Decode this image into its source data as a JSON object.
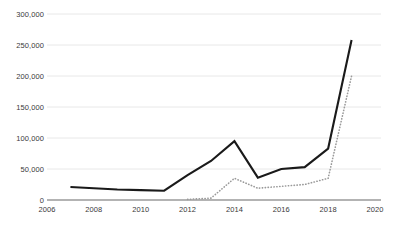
{
  "chart_data": {
    "type": "line",
    "title": "",
    "subtitle": "",
    "xlabel": "",
    "ylabel": "",
    "xlim": [
      2006,
      2020
    ],
    "ylim": [
      0,
      300000
    ],
    "grid": true,
    "legend_position": "none",
    "x_tick_labels": [
      "2006",
      "2008",
      "2010",
      "2012",
      "2014",
      "2016",
      "2018",
      "2020"
    ],
    "x_ticks": [
      2006,
      2008,
      2010,
      2012,
      2014,
      2016,
      2018,
      2020
    ],
    "y_tick_labels": [
      "300,000",
      "250,000",
      "200,000",
      "150,000",
      "100,000",
      "50,000",
      "0"
    ],
    "y_ticks": [
      300000,
      250000,
      200000,
      150000,
      100000,
      50000,
      0
    ],
    "series": [
      {
        "name": "series-solid",
        "style": "solid",
        "color": "#1a1a1a",
        "x": [
          2007,
          2008,
          2009,
          2010,
          2011,
          2012,
          2013,
          2014,
          2015,
          2016,
          2017,
          2018,
          2019
        ],
        "values": [
          21000,
          19000,
          17000,
          16000,
          15000,
          40000,
          63000,
          95000,
          36000,
          50000,
          53000,
          83000,
          258000
        ]
      },
      {
        "name": "series-dotted",
        "style": "dotted",
        "color": "#9a9a9a",
        "x": [
          2012,
          2013,
          2014,
          2015,
          2016,
          2017,
          2018,
          2019
        ],
        "values": [
          1000,
          3000,
          35000,
          19000,
          22000,
          25000,
          35000,
          200000
        ]
      }
    ]
  }
}
